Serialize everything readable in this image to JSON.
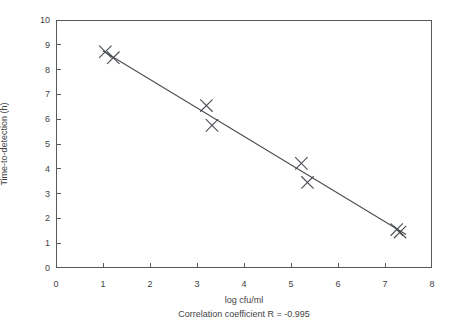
{
  "chart_data": {
    "type": "scatter",
    "title": "",
    "xlabel": "log cfu/ml",
    "ylabel": "Time-to-detection (h)",
    "annotation": "Correlation coefficient R = -0.995",
    "xlim": [
      0,
      8
    ],
    "ylim": [
      0,
      10
    ],
    "xticks": [
      0,
      1,
      2,
      3,
      4,
      5,
      6,
      7,
      8
    ],
    "yticks": [
      0,
      1,
      2,
      3,
      4,
      5,
      6,
      7,
      8,
      9,
      10
    ],
    "xtick_labels": [
      "0",
      "1",
      "2",
      "3",
      "4",
      "5",
      "6",
      "7",
      "8"
    ],
    "ytick_labels": [
      "0",
      "1",
      "2",
      "3",
      "4",
      "5",
      "6",
      "7",
      "8",
      "9",
      "10"
    ],
    "grid": false,
    "legend": "none",
    "marker": "x",
    "marker_color": "#4a4e52",
    "line_color": "#4a4e52",
    "points": [
      {
        "x": 1.05,
        "y": 8.72
      },
      {
        "x": 1.22,
        "y": 8.48
      },
      {
        "x": 3.2,
        "y": 6.55
      },
      {
        "x": 3.32,
        "y": 5.75
      },
      {
        "x": 5.22,
        "y": 4.22
      },
      {
        "x": 5.35,
        "y": 3.45
      },
      {
        "x": 7.25,
        "y": 1.55
      },
      {
        "x": 7.32,
        "y": 1.45
      }
    ],
    "fit_line": {
      "x_start": 1.0,
      "y_start": 8.75,
      "x_end": 7.45,
      "y_end": 1.35,
      "correlation_r": -0.995
    }
  },
  "axes": {
    "x_title": "log cfu/ml",
    "y_title": "Time-to-detection (h)"
  },
  "caption": {
    "correlation": "Correlation coefficient R = -0.995"
  }
}
